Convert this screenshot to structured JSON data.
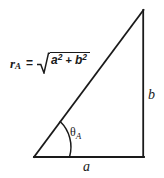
{
  "figure": {
    "type": "right-triangle-diagram",
    "background_color": "#ffffff",
    "stroke_color": "#1a1a1a",
    "formula": {
      "variable": "r",
      "variable_subscript": "A",
      "equals": "=",
      "radical_glyph": "√",
      "term1_base": "a",
      "term1_exponent": "2",
      "operator": "+",
      "term2_base": "b",
      "term2_exponent": "2",
      "full_text": "r_A = √(a² + b²)"
    },
    "angle_label": {
      "symbol": "θ",
      "subscript": "A",
      "full_text": "θ_A"
    },
    "side_labels": {
      "horizontal": "a",
      "vertical": "b"
    },
    "geometry": {
      "vertex_bottom_left": [
        34,
        157
      ],
      "vertex_bottom_right": [
        144,
        157
      ],
      "vertex_top_right": [
        144,
        10
      ],
      "arc_radius": 35
    }
  }
}
